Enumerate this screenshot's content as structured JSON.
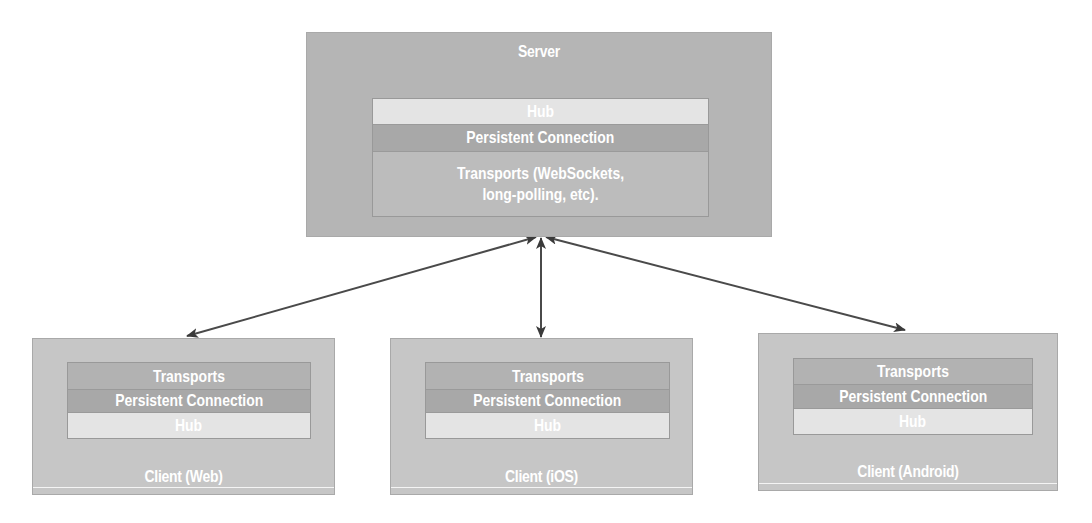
{
  "server": {
    "title": "Server",
    "layers": [
      {
        "name": "hub",
        "label": "Hub"
      },
      {
        "name": "persistent-connection",
        "label": "Persistent Connection"
      },
      {
        "name": "transports",
        "label": "Transports (WebSockets, long-polling, etc)."
      }
    ]
  },
  "clients": [
    {
      "title": "Client (Web)",
      "layers": [
        {
          "name": "transports",
          "label": "Transports"
        },
        {
          "name": "persistent-connection",
          "label": "Persistent Connection"
        },
        {
          "name": "hub",
          "label": "Hub"
        }
      ]
    },
    {
      "title": "Client (iOS)",
      "layers": [
        {
          "name": "transports",
          "label": "Transports"
        },
        {
          "name": "persistent-connection",
          "label": "Persistent Connection"
        },
        {
          "name": "hub",
          "label": "Hub"
        }
      ]
    },
    {
      "title": "Client (Android)",
      "layers": [
        {
          "name": "transports",
          "label": "Transports"
        },
        {
          "name": "persistent-connection",
          "label": "Persistent Connection"
        },
        {
          "name": "hub",
          "label": "Hub"
        }
      ]
    }
  ],
  "connections": [
    {
      "from": "server",
      "to": "client-web",
      "type": "bidirectional-arrow"
    },
    {
      "from": "server",
      "to": "client-ios",
      "type": "bidirectional-arrow"
    },
    {
      "from": "server",
      "to": "client-android",
      "type": "bidirectional-arrow"
    }
  ],
  "colors": {
    "server_bg": "#b5b5b5",
    "client_bg": "#c6c6c6",
    "hub": "#e4e4e4",
    "persistent_connection": "#a8a8a8",
    "transports_server": "#bcbcbc",
    "transports_client": "#b2b2b2",
    "arrow": "#3a3a3a",
    "text": "#ffffff"
  }
}
